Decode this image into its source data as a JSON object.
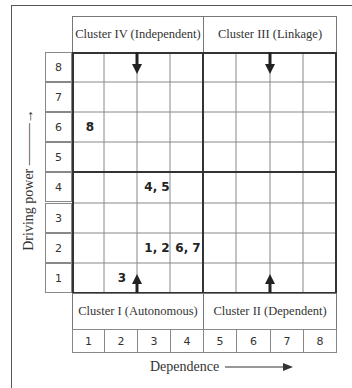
{
  "quadrants": {
    "top_left": "Cluster IV (Independent)",
    "top_right": "Cluster III  (Linkage)",
    "bottom_left": "Cluster I (Autonomous)",
    "bottom_right": "Cluster II (Dependent)"
  },
  "axes": {
    "y_label": "Driving power",
    "x_label": "Dependence",
    "y_ticks": [
      "8",
      "7",
      "6",
      "5",
      "4",
      "3",
      "2",
      "1"
    ],
    "x_ticks": [
      "1",
      "2",
      "3",
      "4",
      "5",
      "6",
      "7",
      "8"
    ]
  },
  "points": [
    {
      "label": "8",
      "dependence": 1,
      "driving": 6
    },
    {
      "label": "4, 5",
      "dependence": 3,
      "driving": 4
    },
    {
      "label": "1, 2",
      "dependence": 3,
      "driving": 2
    },
    {
      "label": "6, 7",
      "dependence": 4,
      "driving": 2
    },
    {
      "label": "3",
      "dependence": 2,
      "driving": 1
    }
  ],
  "cells": {
    "r6c1": "8",
    "r4c3": "4, 5",
    "r2c3": "1, 2",
    "r2c4": "6, 7",
    "r1c2": "3"
  },
  "arrows": {
    "y_arrow": "↑",
    "x_arrow": "→"
  }
}
